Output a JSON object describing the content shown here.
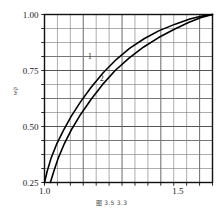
{
  "figure": {
    "caption": "图 3.5    3.3",
    "y_axis_title": "w/p"
  },
  "chart_data": {
    "type": "line",
    "title": "",
    "xlabel": "",
    "ylabel": "w/p",
    "xlim": [
      1.0,
      1.63
    ],
    "ylim": [
      0.25,
      1.0
    ],
    "grid": true,
    "legend": "inline-curve-labels",
    "xticks": [
      1.0,
      1.5
    ],
    "xticklabels": [
      "1.0",
      "1.5"
    ],
    "yticks": [
      0.25,
      0.5,
      0.75,
      1.0
    ],
    "yticklabels": [
      "0.25",
      "0.50",
      "0.75",
      "1.00"
    ],
    "minor_grid_x_count": 13,
    "minor_grid_y_count": 12,
    "series": [
      {
        "name": "1",
        "label": "1",
        "color": "#000000",
        "label_x": 1.17,
        "label_y": 0.8,
        "x": [
          1.0,
          1.01,
          1.025,
          1.045,
          1.07,
          1.1,
          1.135,
          1.175,
          1.22,
          1.27,
          1.32,
          1.375,
          1.43,
          1.49,
          1.545,
          1.59,
          1.63
        ],
        "y": [
          0.25,
          0.3,
          0.36,
          0.42,
          0.48,
          0.545,
          0.61,
          0.675,
          0.74,
          0.8,
          0.85,
          0.893,
          0.928,
          0.957,
          0.98,
          0.993,
          1.0
        ]
      },
      {
        "name": "2",
        "label": "2",
        "color": "#000000",
        "label_x": 1.215,
        "label_y": 0.705,
        "x": [
          1.022,
          1.035,
          1.052,
          1.075,
          1.103,
          1.136,
          1.175,
          1.218,
          1.265,
          1.318,
          1.372,
          1.428,
          1.485,
          1.54,
          1.585,
          1.63
        ],
        "y": [
          0.25,
          0.3,
          0.36,
          0.425,
          0.49,
          0.555,
          0.622,
          0.688,
          0.75,
          0.806,
          0.855,
          0.897,
          0.933,
          0.964,
          0.986,
          1.0
        ]
      }
    ]
  }
}
